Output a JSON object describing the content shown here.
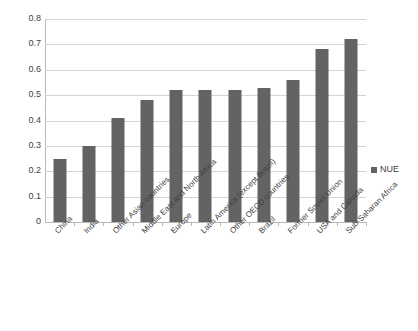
{
  "chart_data": {
    "type": "bar",
    "title": "",
    "subtitle": "",
    "xlabel": "",
    "ylabel": "",
    "ylim": [
      0,
      0.8
    ],
    "ytick_labels": [
      "0.8",
      "0.7",
      "0.6",
      "0.5",
      "0.4",
      "0.3",
      "0.2",
      "0.1",
      "0"
    ],
    "ytick_values": [
      0.8,
      0.7,
      0.6,
      0.5,
      0.4,
      0.3,
      0.2,
      0.1,
      0
    ],
    "grid": true,
    "legend_position": "right",
    "categories": [
      "China",
      "India",
      "Other Asian countries",
      "Middle East and North Africa",
      "Europe",
      "Latin America (except Brazil)",
      "Other OECD countries",
      "Brazil",
      "Former Soviet Union",
      "USA and Canada",
      "Sub-Saharan Africa"
    ],
    "series": [
      {
        "name": "NUE",
        "color": "#636363",
        "values": [
          0.25,
          0.3,
          0.41,
          0.48,
          0.52,
          0.52,
          0.52,
          0.53,
          0.56,
          0.68,
          0.72
        ]
      }
    ]
  },
  "legend": {
    "entries": [
      {
        "label": "NUE",
        "color": "#636363",
        "marker": "square-marker"
      }
    ]
  },
  "colors": {
    "bar": "#636363",
    "gridline": "#d3d3d3",
    "axis": "#b8b8b8",
    "text": "#3f3f3f",
    "background": "#ffffff"
  }
}
